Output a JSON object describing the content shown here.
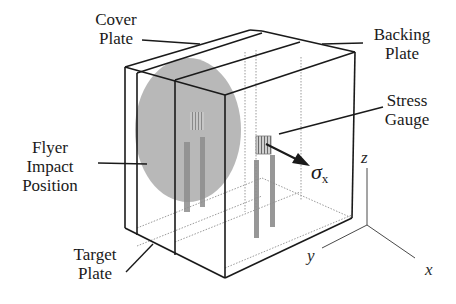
{
  "figure": {
    "labels": {
      "cover_plate": [
        "Cover",
        "Plate"
      ],
      "backing_plate": [
        "Backing",
        "Plate"
      ],
      "stress_gauge": [
        "Stress",
        "Gauge"
      ],
      "flyer_impact_position": [
        "Flyer",
        "Impact",
        "Position"
      ],
      "target_plate": [
        "Target",
        "Plate"
      ]
    },
    "stress_symbol": {
      "symbol": "σ",
      "subscript": "x"
    },
    "axes": {
      "x": "x",
      "y": "y",
      "z": "z"
    },
    "components": [
      "cover plate",
      "target plate",
      "backing plate",
      "flyer impact circle",
      "stress gauge (grid element)",
      "gauge leads",
      "coordinate axes"
    ],
    "colors": {
      "line": "#1a1a1a",
      "flyer_circle": "#b4b4b4",
      "gauge_leads": "#8c8c8c",
      "hidden_lines": "#9a9a9a",
      "background": "#ffffff"
    }
  }
}
